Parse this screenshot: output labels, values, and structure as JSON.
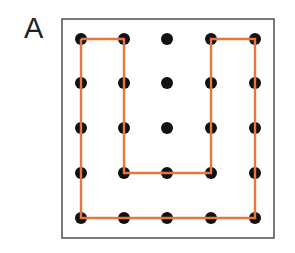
{
  "panel": {
    "label": "A",
    "box": {
      "x": 62,
      "y": 19,
      "w": 212,
      "h": 219,
      "stroke": "#333333"
    },
    "grid": {
      "cols_x": [
        81,
        124,
        167,
        211,
        255
      ],
      "rows_y": [
        39,
        83,
        128,
        173,
        218
      ],
      "dot_radius": 6,
      "dot_color": "#111111"
    },
    "path": {
      "color": "#e8763f",
      "width": 2.4,
      "points": [
        [
          81,
          39
        ],
        [
          124,
          39
        ],
        [
          124,
          173
        ],
        [
          211,
          173
        ],
        [
          211,
          39
        ],
        [
          255,
          39
        ],
        [
          255,
          218
        ],
        [
          81,
          218
        ],
        [
          81,
          39
        ]
      ]
    }
  }
}
